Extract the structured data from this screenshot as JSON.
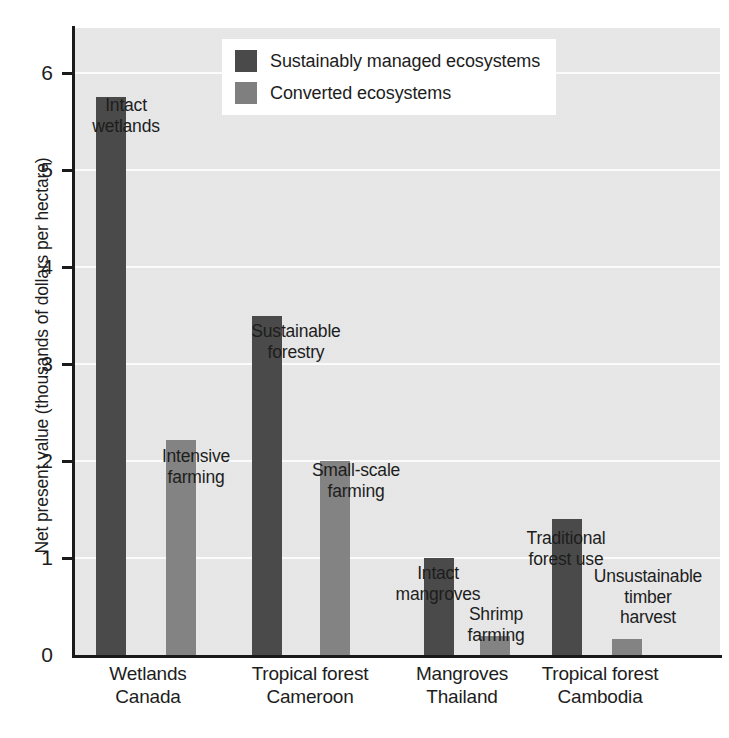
{
  "chart_data": {
    "type": "bar",
    "title": "",
    "xlabel": "",
    "ylabel": "Net present value (thousands of dollars per hectare)",
    "ylim": [
      0,
      6.45
    ],
    "ytick_labels": [
      "0",
      "1",
      "2",
      "3",
      "4",
      "5",
      "6"
    ],
    "ytick_values": [
      0,
      1,
      2,
      3,
      4,
      5,
      6
    ],
    "grid": true,
    "legend_position": "top-center",
    "categories": [
      "Wetlands\nCanada",
      "Tropical forest\nCameroon",
      "Mangroves\nThailand",
      "Tropical forest\nCambodia"
    ],
    "series": [
      {
        "name": "Sustainably managed ecosystems",
        "color": "#4a4a4a",
        "values": [
          5.75,
          3.5,
          1.0,
          1.4
        ],
        "point_labels": [
          "Intact\nwetlands",
          "Sustainable\nforestry",
          "Intact\nmangroves",
          "Traditional\nforest use"
        ]
      },
      {
        "name": "Converted ecosystems",
        "color": "#838383",
        "values": [
          2.22,
          2.0,
          0.2,
          0.17
        ],
        "point_labels": [
          "Intensive\nfarming",
          "Small-scale\nfarming",
          "Shrimp\nfarming",
          "Unsustainable\ntimber\nharvest"
        ]
      }
    ]
  },
  "legend": {
    "items": [
      {
        "label": "Sustainably managed ecosystems",
        "swatch": "dark"
      },
      {
        "label": "Converted ecosystems",
        "swatch": "light"
      }
    ]
  },
  "colors": {
    "sustainable": "#4a4a4a",
    "converted": "#838383",
    "plot_background": "#e9e9e9",
    "gridline": "#fbfbfb",
    "axis": "#1a1a1a",
    "text": "#1d1d1d"
  }
}
